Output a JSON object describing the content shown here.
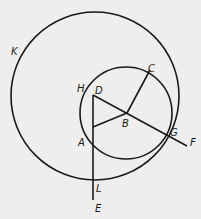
{
  "figure": {
    "background": "#efeeec",
    "stroke": "#1a1a1a",
    "circles": [
      {
        "name": "K",
        "cx": 95,
        "cy": 96,
        "r": 84
      },
      {
        "name": "small",
        "cx": 126,
        "cy": 113,
        "r": 46
      }
    ],
    "points": {
      "D": [
        93,
        95
      ],
      "B": [
        127,
        113
      ],
      "C": [
        150,
        70
      ],
      "A": [
        93,
        127
      ],
      "G": [
        167,
        135
      ],
      "F": [
        187,
        146
      ],
      "H": [
        85,
        89
      ],
      "L": [
        93,
        180
      ],
      "E": [
        93,
        200
      ]
    },
    "labels": {
      "K": "K",
      "H": "H",
      "D": "D",
      "C": "C",
      "B": "B",
      "A": "A",
      "G": "G",
      "F": "F",
      "L": "L",
      "E": "E"
    }
  }
}
